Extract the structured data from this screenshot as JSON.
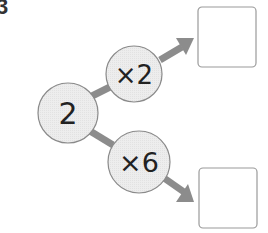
{
  "problem": {
    "number": "3"
  },
  "start": {
    "value": "2"
  },
  "branches": [
    {
      "operator": "×2",
      "answer_box": ""
    },
    {
      "operator": "×6",
      "answer_box": ""
    }
  ],
  "colors": {
    "circle_fill": "#ececec",
    "circle_stroke": "#8a8a8a",
    "arrow": "#8c8c8c",
    "box_stroke": "#9a9a9a"
  }
}
